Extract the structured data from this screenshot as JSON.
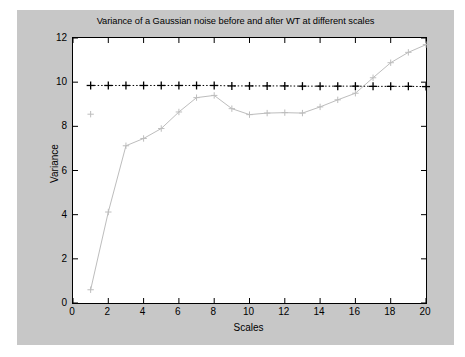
{
  "figure": {
    "background_color": "#c7c7c7",
    "axes_background_color": "#ffffff",
    "axes_border_color": "#000000"
  },
  "chart_data": {
    "type": "line",
    "title": "Variance of a Gaussian noise before and after WT at different scales",
    "xlabel": "Scales",
    "ylabel": "Variance",
    "xlim": [
      0,
      20
    ],
    "ylim": [
      0,
      12
    ],
    "xticks": [
      0,
      2,
      4,
      6,
      8,
      10,
      12,
      14,
      16,
      18,
      20
    ],
    "yticks": [
      0,
      2,
      4,
      6,
      8,
      10,
      12
    ],
    "xtick_labels": [
      "0",
      "2",
      "4",
      "6",
      "8",
      "10",
      "12",
      "14",
      "16",
      "18",
      "20"
    ],
    "ytick_labels": [
      "0",
      "2",
      "4",
      "6",
      "8",
      "10",
      "12"
    ],
    "grid": false,
    "legend": null,
    "x": [
      1,
      2,
      3,
      4,
      5,
      6,
      7,
      8,
      9,
      10,
      11,
      12,
      13,
      14,
      15,
      16,
      17,
      18,
      19,
      20
    ],
    "series": [
      {
        "name": "Variance before WT",
        "marker": "+",
        "linestyle": "dotted",
        "color": "#000000",
        "values": [
          9.85,
          9.85,
          9.85,
          9.85,
          9.85,
          9.85,
          9.85,
          9.85,
          9.83,
          9.83,
          9.83,
          9.83,
          9.82,
          9.82,
          9.82,
          9.82,
          9.81,
          9.81,
          9.81,
          9.8
        ]
      },
      {
        "name": "Variance after WT",
        "marker": "+",
        "linestyle": "solid",
        "color": "#bdbdbd",
        "values": [
          0.6,
          4.12,
          7.12,
          7.45,
          7.9,
          8.65,
          9.3,
          9.4,
          8.8,
          8.53,
          8.6,
          8.62,
          8.6,
          8.88,
          9.2,
          9.5,
          10.2,
          10.88,
          11.35,
          11.7
        ]
      },
      {
        "name": "Variance before WT (isolated marker)",
        "marker": "+",
        "linestyle": "none",
        "color": "#bdbdbd",
        "values_at_x1": 8.55
      }
    ],
    "annotations": []
  }
}
